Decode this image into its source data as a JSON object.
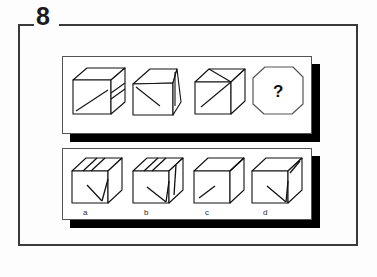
{
  "question": {
    "number": "8",
    "type": "spatial-reasoning-cube-rotation"
  },
  "question_row": {
    "name": "question-sequence-panel",
    "items": [
      {
        "id": "q1",
        "kind": "cube",
        "description": "cube with diagonal line on front face and horizontal band on right face"
      },
      {
        "id": "q2",
        "kind": "cube",
        "description": "cube rotated, diagonal line on front face meeting top-left, narrow right face"
      },
      {
        "id": "q3",
        "kind": "cube",
        "description": "cube with diagonal line on front face and diagonal on top face"
      },
      {
        "id": "q4",
        "kind": "unknown",
        "symbol": "?",
        "description": "octagonal blank tile containing a question mark"
      }
    ]
  },
  "answer_row": {
    "name": "answer-options-panel",
    "options": [
      {
        "id": "a",
        "label": "a",
        "description": "cube with V-shaped arrow on front face and diagonal band across top face"
      },
      {
        "id": "b",
        "label": "b",
        "description": "cube with V-shaped arrow on front face, diagonal band on top, line on right face"
      },
      {
        "id": "c",
        "label": "c",
        "description": "cube with short diagonal on front face and plain right face"
      },
      {
        "id": "d",
        "label": "d",
        "description": "cube with arrow pointing to bottom-right corner and line on right face"
      }
    ]
  },
  "colors": {
    "ink": "#1b1b1b",
    "frame": "#3a3a3a",
    "panel_border": "#555555",
    "panel_fill": "#ffffff",
    "shadow": "#000000",
    "page_background": "#fdfdfd"
  }
}
